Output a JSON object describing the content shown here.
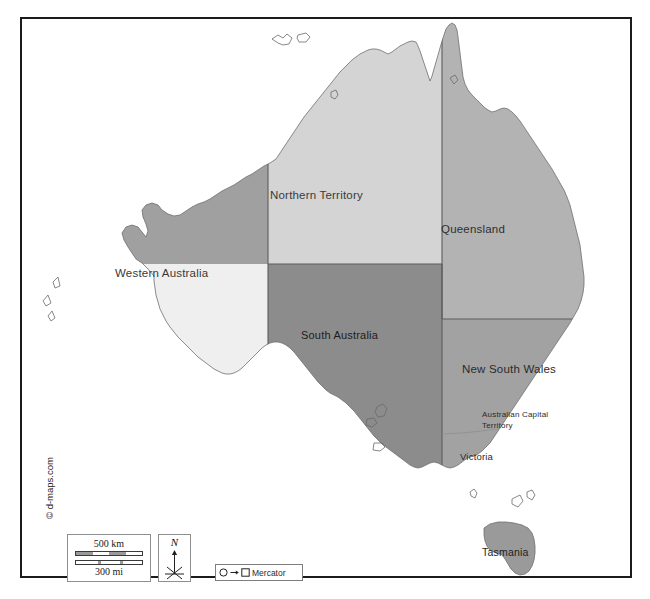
{
  "map": {
    "title": "Australia - states and territories",
    "projection": "Mercator",
    "attribution": "© d-maps.com",
    "frame": {
      "border_color": "#1b1b1b"
    },
    "ocean_color": "#ffffff",
    "states": [
      {
        "id": "wa",
        "name": "Western Australia",
        "fill": "#efefef"
      },
      {
        "id": "nt",
        "name": "Northern Territory",
        "fill": "#d4d4d4"
      },
      {
        "id": "qld",
        "name": "Queensland",
        "fill": "#b3b3b3"
      },
      {
        "id": "sa",
        "name": "South Australia",
        "fill": "#8c8c8c"
      },
      {
        "id": "nsw",
        "name": "New South Wales",
        "fill": "#a2a2a2"
      },
      {
        "id": "act",
        "name": "Australian Capital Territory",
        "name_line1": "Australian Capital",
        "name_line2": "Territory",
        "fill": "#a2a2a2"
      },
      {
        "id": "vic",
        "name": "Victoria",
        "fill": "#a2a2a2"
      },
      {
        "id": "tas",
        "name": "Tasmania",
        "fill": "#9a9a9a"
      },
      {
        "id": "wa_north",
        "name": "Western Australia north region",
        "fill": "#a0a0a0"
      }
    ]
  },
  "scale": {
    "km_label": "500 km",
    "mi_label": "300 mi"
  },
  "compass": {
    "north_letter": "N"
  },
  "projection_legend": {
    "label": "Mercator",
    "from_icon": "circle-icon",
    "arrow_icon": "arrow-right-icon",
    "to_icon": "square-icon"
  },
  "copyright": {
    "text": "© d-maps.com"
  }
}
